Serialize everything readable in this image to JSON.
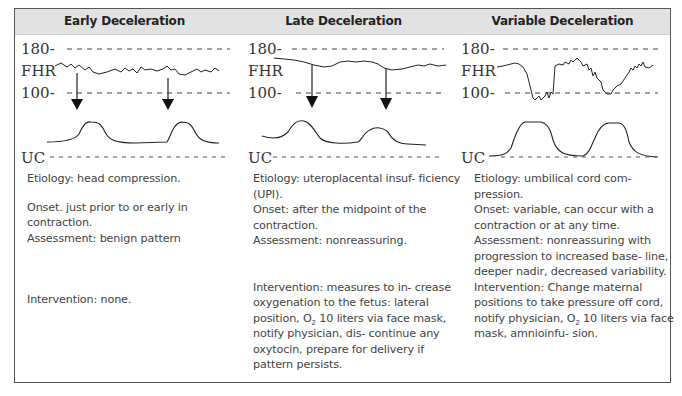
{
  "columns": [
    {
      "title": "Early Deceleration",
      "strip": {
        "upper_label": "180-",
        "fhr_label": "FHR",
        "lower_label": "100-",
        "uc_label": "UC"
      },
      "etiology": "Etiology: head compression.",
      "onset": "Onset. just prior to or early in contraction.",
      "assessment": "Assessment: benign pattern",
      "intervention": "Intervention: none."
    },
    {
      "title": "Late Deceleration",
      "strip": {
        "upper_label": "180-",
        "fhr_label": "FHR",
        "lower_label": "100-",
        "uc_label": "UC"
      },
      "etiology": "Etiology: uteroplacental insuf- ficiency (UPI).",
      "onset": "Onset: after the midpoint of the contraction.",
      "assessment": "Assessment: nonreassuring.",
      "intervention_a": "Intervention: measures to in- crease oxygenation to the fetus: lateral position, O",
      "intervention_sub": "2",
      "intervention_b": " 10 liters via face mask, notify physician, dis- continue any oxytocin, prepare for delivery if pattern persists."
    },
    {
      "title": "Variable Deceleration",
      "strip": {
        "upper_label": "180-",
        "fhr_label": "FHR",
        "lower_label": "100-",
        "uc_label": "UC"
      },
      "etiology": "Etiology: umbilical cord com- pression.",
      "onset": "Onset: variable, can occur with a contraction or at any time.",
      "assessment": "Assessment: nonreassuring with progression to increased base- line, deeper nadir, decreased variability.",
      "intervention_a": "Intervention: Change maternal positions to take pressure off cord, notify physician, O",
      "intervention_sub": "2",
      "intervention_b": " 10 liters via face mask, amnioinfu- sion."
    }
  ],
  "colors": {
    "header_bg": "#e2e2e2",
    "border": "#555555",
    "trace": "#222222",
    "text": "#444444"
  }
}
